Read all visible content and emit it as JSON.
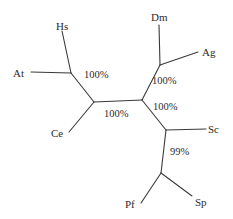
{
  "figure": {
    "kind": "unrooted-phylogenetic-tree",
    "width": 233,
    "height": 219,
    "background_color": "#ffffff",
    "line_color": "#3a3a3a",
    "text_color": "#2b2b2b"
  },
  "taxa": [
    {
      "id": "hs",
      "label": "Hs",
      "x": 56,
      "y": 21
    },
    {
      "id": "at",
      "label": "At",
      "x": 13,
      "y": 68
    },
    {
      "id": "ce",
      "label": "Ce",
      "x": 51,
      "y": 128
    },
    {
      "id": "dm",
      "label": "Dm",
      "x": 151,
      "y": 12
    },
    {
      "id": "ag",
      "label": "Ag",
      "x": 202,
      "y": 47
    },
    {
      "id": "sc",
      "label": "Sc",
      "x": 208,
      "y": 124
    },
    {
      "id": "pf",
      "label": "Pf",
      "x": 125,
      "y": 199
    },
    {
      "id": "sp",
      "label": "Sp",
      "x": 195,
      "y": 197
    }
  ],
  "support_values": [
    {
      "id": "support-hs-at",
      "label": "100%",
      "x": 84,
      "y": 70
    },
    {
      "id": "support-backbone",
      "label": "100%",
      "x": 104,
      "y": 109
    },
    {
      "id": "support-dm-ag",
      "label": "100%",
      "x": 152,
      "y": 76
    },
    {
      "id": "support-fungi",
      "label": "100%",
      "x": 153,
      "y": 102
    },
    {
      "id": "support-pf-sp",
      "label": "99%",
      "x": 170,
      "y": 147
    }
  ],
  "nodes": [
    {
      "id": "node-hs-at",
      "x": 71,
      "y": 73
    },
    {
      "id": "node-left-center",
      "x": 94,
      "y": 102
    },
    {
      "id": "node-right-center",
      "x": 142,
      "y": 100
    },
    {
      "id": "node-dm-ag",
      "x": 160,
      "y": 65
    },
    {
      "id": "node-sc",
      "x": 166,
      "y": 130
    },
    {
      "id": "node-pf-sp",
      "x": 161,
      "y": 173
    }
  ],
  "branches": [
    {
      "id": "branch-hs",
      "x1": 62,
      "y1": 31,
      "x2": 71,
      "y2": 73
    },
    {
      "id": "branch-at",
      "x1": 31,
      "y1": 72,
      "x2": 71,
      "y2": 73
    },
    {
      "id": "branch-hsat-center",
      "x1": 71,
      "y1": 73,
      "x2": 94,
      "y2": 102
    },
    {
      "id": "branch-ce",
      "x1": 69,
      "y1": 132,
      "x2": 94,
      "y2": 102
    },
    {
      "id": "branch-backbone",
      "x1": 94,
      "y1": 102,
      "x2": 142,
      "y2": 100
    },
    {
      "id": "branch-dmag-center",
      "x1": 142,
      "y1": 100,
      "x2": 160,
      "y2": 65
    },
    {
      "id": "branch-dm",
      "x1": 159,
      "y1": 25,
      "x2": 160,
      "y2": 65
    },
    {
      "id": "branch-ag",
      "x1": 160,
      "y1": 65,
      "x2": 198,
      "y2": 52
    },
    {
      "id": "branch-center-sc-node",
      "x1": 142,
      "y1": 100,
      "x2": 166,
      "y2": 130
    },
    {
      "id": "branch-sc",
      "x1": 166,
      "y1": 130,
      "x2": 206,
      "y2": 129
    },
    {
      "id": "branch-scnode-pfsp",
      "x1": 166,
      "y1": 130,
      "x2": 161,
      "y2": 173
    },
    {
      "id": "branch-pf",
      "x1": 161,
      "y1": 173,
      "x2": 141,
      "y2": 203
    },
    {
      "id": "branch-sp",
      "x1": 161,
      "y1": 173,
      "x2": 192,
      "y2": 196
    }
  ]
}
